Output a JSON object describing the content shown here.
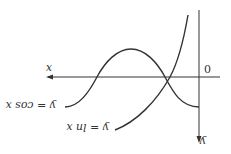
{
  "diagram": {
    "rotation_deg": 180,
    "axes": {
      "x_label": "x",
      "y_label": "y",
      "origin_label": "0"
    },
    "curves": [
      {
        "name": "cos",
        "label": "y = cos x"
      },
      {
        "name": "ln",
        "label": "y = ln x"
      }
    ],
    "colors": {
      "stroke": "#333333",
      "background": "#ffffff"
    }
  }
}
